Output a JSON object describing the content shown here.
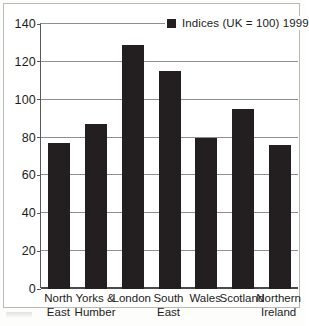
{
  "chart_data": {
    "type": "bar",
    "title": "",
    "subtitle": "",
    "xlabel": "",
    "ylabel": "",
    "ylim": [
      0,
      140
    ],
    "ytick_step": 20,
    "yticks": [
      0,
      20,
      40,
      60,
      80,
      100,
      120,
      140
    ],
    "grid": true,
    "legend_position": "top-right-inside",
    "categories": [
      "North East",
      "Yorks & Humber",
      "London",
      "South East",
      "Wales",
      "Scotland",
      "Northern Ireland"
    ],
    "category_lines": [
      [
        "North",
        "East"
      ],
      [
        "Yorks &",
        "Humber"
      ],
      [
        "London",
        ""
      ],
      [
        "South",
        "East"
      ],
      [
        "Wales",
        ""
      ],
      [
        "Scotland",
        ""
      ],
      [
        "Northern",
        "Ireland"
      ]
    ],
    "series": [
      {
        "name": "Indices (UK = 100) 1999",
        "values": [
          77,
          87,
          129,
          115,
          80,
          95,
          76
        ],
        "color": "#231f20"
      }
    ],
    "reference_value": 100,
    "reference_note": "UK = 100"
  },
  "legend": {
    "swatch_name": "legend-color-swatch",
    "label": "Indices (UK = 100) 1999"
  },
  "axes": {
    "y_tick_labels": [
      "0",
      "20",
      "40",
      "60",
      "80",
      "100",
      "120",
      "140"
    ],
    "y_max_label": "140",
    "y_min_label": "0"
  },
  "colors": {
    "bar": "#231f20",
    "gridline": "#8e8e90",
    "axis": "#58585a",
    "frame_border": "#b9b9b5",
    "plot_background": "#ffffff",
    "text": "#1c1c1c"
  }
}
